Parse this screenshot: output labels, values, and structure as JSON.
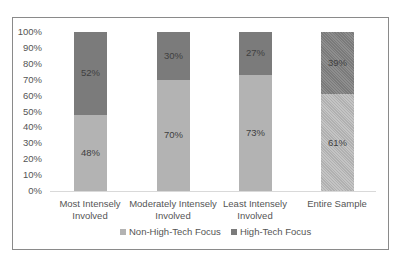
{
  "chart_data": {
    "type": "bar",
    "stacked": true,
    "percent": true,
    "title": "",
    "xlabel": "",
    "ylabel": "",
    "ylim": [
      0,
      100
    ],
    "yticks": [
      "0%",
      "10%",
      "20%",
      "30%",
      "40%",
      "50%",
      "60%",
      "70%",
      "80%",
      "90%",
      "100%"
    ],
    "categories": [
      "Most Intensely Involved",
      "Moderately Intensely Involved",
      "Least Intensely Involved",
      "Entire Sample"
    ],
    "category_lines": [
      [
        "Most Intensely",
        "Involved"
      ],
      [
        "Moderately Intensely",
        "Involved"
      ],
      [
        "Least Intensely",
        "Involved"
      ],
      [
        "Entire Sample",
        ""
      ]
    ],
    "series": [
      {
        "name": "Non-High-Tech Focus",
        "values": [
          48,
          70,
          73,
          61
        ],
        "labels": [
          "48%",
          "70%",
          "73%",
          "61%"
        ],
        "color": "#b3b3b3"
      },
      {
        "name": "High-Tech Focus",
        "values": [
          52,
          30,
          27,
          39
        ],
        "labels": [
          "52%",
          "30%",
          "27%",
          "39%"
        ],
        "color": "#7b7b7b"
      }
    ],
    "legend_position": "bottom",
    "grid": false
  }
}
